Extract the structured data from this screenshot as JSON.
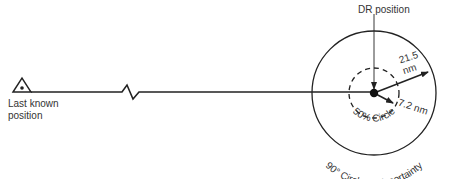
{
  "diagram": {
    "type": "search-area-diagram",
    "labels": {
      "last_known_position_line1": "Last known",
      "last_known_position_line2": "position",
      "dr_position": "DR position",
      "outer_radius_value": "21.5",
      "outer_radius_unit": "nm",
      "inner_radius": "7.2 nm",
      "inner_circle": "50% Circle",
      "outer_circle": "90° Circle of Uncertainty"
    },
    "colors": {
      "stroke": "#222222",
      "text": "#333333",
      "background": "#ffffff"
    },
    "nodes": [
      {
        "id": "last-known-position",
        "symbol": "triangle-with-dot"
      },
      {
        "id": "dr-position",
        "symbol": "filled-circle"
      }
    ],
    "edges": [
      {
        "from": "last-known-position",
        "to": "dr-position",
        "style": "solid-with-break"
      }
    ],
    "circles": [
      {
        "name": "50% Circle",
        "radius": "7.2 nm",
        "style": "dashed"
      },
      {
        "name": "90° Circle of Uncertainty",
        "radius": "21.5 nm",
        "style": "solid"
      }
    ]
  }
}
